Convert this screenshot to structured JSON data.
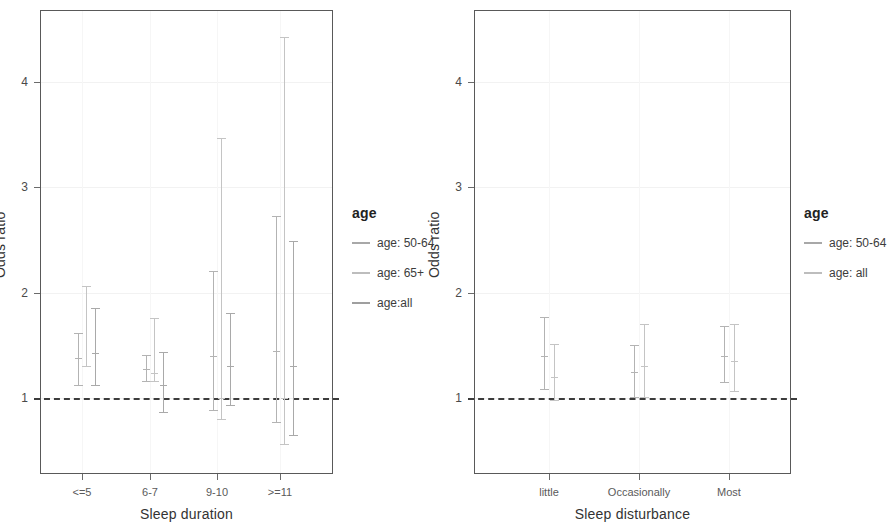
{
  "chart_data": [
    {
      "type": "scatter",
      "panel": "left",
      "title": "",
      "xlabel": "Sleep duration",
      "ylabel": "Odds ratio",
      "categories": [
        "<=5",
        "6-7",
        "9-10",
        ">=11"
      ],
      "yticks": [
        1,
        2,
        3,
        4
      ],
      "ylim": [
        0.42,
        4.72
      ],
      "grid": true,
      "reference_line": {
        "value": 1,
        "style": "dashed"
      },
      "legend": {
        "title": "age",
        "position": "right",
        "entries": [
          "age: 50-64",
          "age: 65+",
          "age:all"
        ]
      },
      "series": [
        {
          "name": "age: 50-64",
          "points": [
            {
              "category": "<=5",
              "estimate": 1.38,
              "low": 1.11,
              "high": 1.62
            },
            {
              "category": "6-7",
              "estimate": 1.28,
              "low": 1.15,
              "high": 1.41
            },
            {
              "category": "9-10",
              "estimate": 1.4,
              "low": 0.88,
              "high": 2.21
            },
            {
              "category": ">=11",
              "estimate": 1.45,
              "low": 0.76,
              "high": 2.73
            }
          ]
        },
        {
          "name": "age: 65+",
          "points": [
            {
              "category": "<=5",
              "estimate": 1.29,
              "low": 1.29,
              "high": 2.06
            },
            {
              "category": "6-7",
              "estimate": 1.24,
              "low": 1.15,
              "high": 1.76
            },
            {
              "category": "9-10",
              "estimate": 1.0,
              "low": 0.79,
              "high": 3.47
            },
            {
              "category": ">=11",
              "estimate": 1.0,
              "low": 0.55,
              "high": 4.43
            }
          ]
        },
        {
          "name": "age:all",
          "points": [
            {
              "category": "<=5",
              "estimate": 1.43,
              "low": 1.11,
              "high": 1.85
            },
            {
              "category": "6-7",
              "estimate": 1.12,
              "low": 0.86,
              "high": 1.44
            },
            {
              "category": "9-10",
              "estimate": 1.3,
              "low": 0.92,
              "high": 1.81
            },
            {
              "category": ">=11",
              "estimate": 1.3,
              "low": 0.64,
              "high": 2.49
            }
          ]
        }
      ]
    },
    {
      "type": "scatter",
      "panel": "right",
      "title": "",
      "xlabel": "Sleep disturbance",
      "ylabel": "Odds ratio",
      "categories": [
        "little",
        "Occasionally",
        "Most"
      ],
      "yticks": [
        1,
        2,
        3,
        4
      ],
      "ylim": [
        0.42,
        4.72
      ],
      "grid": true,
      "reference_line": {
        "value": 1,
        "style": "dashed"
      },
      "legend": {
        "title": "age",
        "position": "right",
        "entries": [
          "age: 50-64",
          "age: all"
        ]
      },
      "series": [
        {
          "name": "age: 50-64",
          "points": [
            {
              "category": "little",
              "estimate": 1.4,
              "low": 1.08,
              "high": 1.77
            },
            {
              "category": "Occasionally",
              "estimate": 1.25,
              "low": 1.0,
              "high": 1.5
            },
            {
              "category": "Most",
              "estimate": 1.4,
              "low": 1.14,
              "high": 1.68
            }
          ]
        },
        {
          "name": "age: all",
          "points": [
            {
              "category": "little",
              "estimate": 1.2,
              "low": 0.97,
              "high": 1.51
            },
            {
              "category": "Occasionally",
              "estimate": 1.3,
              "low": 1.0,
              "high": 1.7
            },
            {
              "category": "Most",
              "estimate": 1.35,
              "low": 1.06,
              "high": 1.7
            }
          ]
        }
      ]
    }
  ],
  "left_panel": {
    "ytitle": "Odds ratio",
    "xtitle": "Sleep duration",
    "yticklabels": [
      "4",
      "3",
      "2",
      "1"
    ],
    "xticklabels": [
      "<=5",
      "6-7",
      "9-10",
      ">=11"
    ],
    "legend": {
      "title": "age",
      "items": [
        {
          "label": "age: 50-64",
          "color": "#a8a8a8"
        },
        {
          "label": "age: 65+",
          "color": "#bdbdbd"
        },
        {
          "label": "age:all",
          "color": "#9f9f9f"
        }
      ]
    }
  },
  "right_panel": {
    "ytitle": "Odds ratio",
    "xtitle": "Sleep disturbance",
    "yticklabels": [
      "4",
      "3",
      "2",
      "1"
    ],
    "xticklabels": [
      "little",
      "Occasionally",
      "Most"
    ],
    "legend": {
      "title": "age",
      "items": [
        {
          "label": "age: 50-64",
          "color": "#a8a8a8"
        },
        {
          "label": "age: all",
          "color": "#bdbdbd"
        }
      ]
    }
  },
  "colors": {
    "axis": "#595959",
    "grid": "#f2f2f2",
    "refline": "#3c3c3c",
    "series1": "#b3b3b3",
    "series2": "#c4c4c4",
    "series3": "#a9a9a9",
    "text": "#3a3a3a"
  }
}
